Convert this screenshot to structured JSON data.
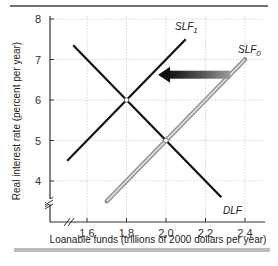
{
  "chart_data": {
    "type": "line",
    "title": "",
    "xlabel": "Loanable funds (trillions of 2000 dollars per year)",
    "ylabel": "Real interest rate (percent per year)",
    "xlim": [
      1.4,
      2.5
    ],
    "ylim": [
      3.5,
      8
    ],
    "x_ticks": [
      "1.6",
      "1.8",
      "2.0",
      "2.2",
      "2.4"
    ],
    "y_ticks": [
      "4",
      "5",
      "6",
      "7",
      "8"
    ],
    "grid": true,
    "series": [
      {
        "name": "DLF",
        "label": "DLF",
        "color": "#111111",
        "points": [
          [
            1.53,
            7.35
          ],
          [
            2.28,
            3.6
          ]
        ]
      },
      {
        "name": "SLF1",
        "label": "SLF",
        "subscript": "1",
        "color": "#111111",
        "points": [
          [
            1.5,
            4.5
          ],
          [
            2.1,
            7.5
          ]
        ]
      },
      {
        "name": "SLF0",
        "label": "SLF",
        "subscript": "0",
        "color": "#a0a0a0",
        "points": [
          [
            1.7,
            3.5
          ],
          [
            2.4,
            7.0
          ]
        ]
      }
    ],
    "equilibria": [
      {
        "x": 1.8,
        "y": 6,
        "desc": "SLF1 ∩ DLF"
      },
      {
        "x": 2.0,
        "y": 5,
        "desc": "SLF0 ∩ DLF"
      }
    ],
    "annotations": [
      {
        "type": "arrow",
        "from": [
          2.35,
          6.6
        ],
        "to": [
          1.98,
          6.6
        ],
        "desc": "Supply of loanable funds shifts left from SLF0 to SLF1"
      }
    ]
  }
}
